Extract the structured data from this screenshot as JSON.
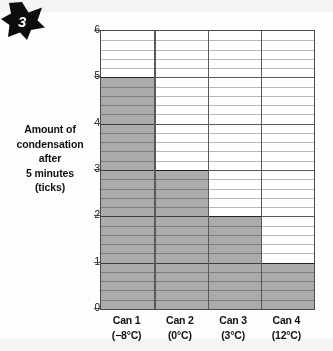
{
  "badge": {
    "name": "star-badge",
    "number": "3"
  },
  "chart_data": {
    "type": "bar",
    "title": "",
    "xlabel": "",
    "ylabel": "Amount of condensation after 5 minutes (ticks)",
    "ylabel_lines": [
      "Amount of",
      "condensation",
      "after",
      "5 minutes",
      "(ticks)"
    ],
    "categories": [
      "Can 1",
      "Can 2",
      "Can 3",
      "Can 4"
    ],
    "category_sublabels": [
      "(−8°C)",
      "(0°C)",
      "(3°C)",
      "(12°C)"
    ],
    "values": [
      5,
      3,
      2,
      1
    ],
    "ylim": [
      0,
      6
    ],
    "ytick_labels": [
      "0",
      "1",
      "2",
      "3",
      "4",
      "5",
      "6"
    ],
    "ytick_values": [
      0,
      1,
      2,
      3,
      4,
      5,
      6
    ],
    "minor_tick_step": 0.2,
    "grid": true,
    "legend": "none",
    "bar_color": "#ababab",
    "axis_color": "#4a4a4a",
    "grid_color": "#b9b9b9",
    "background_color": "#fdfdfd"
  }
}
